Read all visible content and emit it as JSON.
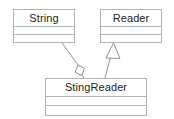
{
  "diagram": {
    "kind": "uml-class-diagram",
    "width": 174,
    "height": 119,
    "background_color": "#ffffff",
    "border_color": "#b2b2ba",
    "text_color": "#1c1c1c",
    "classes": [
      {
        "id": "string",
        "name": "String",
        "attributes": [],
        "operations": []
      },
      {
        "id": "reader",
        "name": "Reader",
        "attributes": [],
        "operations": []
      },
      {
        "id": "stingreader",
        "name": "StingReader",
        "attributes": [],
        "operations": []
      }
    ],
    "relationships": [
      {
        "id": "stingreader-aggregates-string",
        "type": "aggregation",
        "marker": "hollow-diamond",
        "source": "StingReader",
        "target": "String",
        "label": ""
      },
      {
        "id": "stingreader-inherits-reader",
        "type": "generalization",
        "marker": "hollow-triangle",
        "source": "StingReader",
        "target": "Reader",
        "label": ""
      }
    ]
  }
}
